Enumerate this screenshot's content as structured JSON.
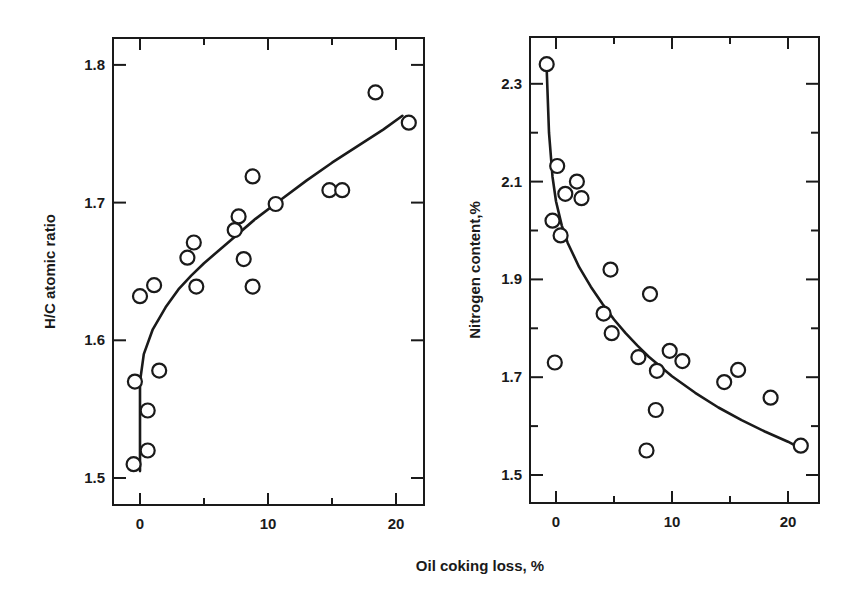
{
  "figure": {
    "xlabel": "Oil coking loss, %",
    "colors": {
      "ink": "#1a1a1a",
      "background": "#ffffff"
    }
  },
  "chart_data": [
    {
      "type": "scatter",
      "title": "",
      "xlabel": "Oil coking loss, %",
      "ylabel": "H/C atomic ratio",
      "xlim": [
        -2,
        22
      ],
      "ylim": [
        1.48,
        1.82
      ],
      "xticks": [
        0,
        10,
        20
      ],
      "xtick_labels": [
        "0",
        "10",
        "20"
      ],
      "xticks_minor": [
        5,
        15
      ],
      "yticks": [
        1.5,
        1.6,
        1.7,
        1.8
      ],
      "ytick_labels": [
        "1.5",
        "1.6",
        "1.7",
        "1.8"
      ],
      "grid": false,
      "legend": null,
      "series": [
        {
          "name": "measured",
          "marker": "open-circle",
          "points": [
            [
              0.0,
              1.632
            ],
            [
              1.1,
              1.64
            ],
            [
              -0.4,
              1.57
            ],
            [
              1.5,
              1.578
            ],
            [
              0.6,
              1.549
            ],
            [
              0.6,
              1.52
            ],
            [
              -0.5,
              1.51
            ],
            [
              3.7,
              1.66
            ],
            [
              4.2,
              1.671
            ],
            [
              4.4,
              1.639
            ],
            [
              7.4,
              1.68
            ],
            [
              7.7,
              1.69
            ],
            [
              8.1,
              1.659
            ],
            [
              8.8,
              1.719
            ],
            [
              8.8,
              1.639
            ],
            [
              10.6,
              1.699
            ],
            [
              14.8,
              1.709
            ],
            [
              15.8,
              1.709
            ],
            [
              18.4,
              1.78
            ],
            [
              21.0,
              1.758
            ]
          ]
        },
        {
          "name": "fit",
          "marker": "line",
          "points": [
            [
              0.0,
              1.505
            ],
            [
              0.0,
              1.57
            ],
            [
              0.3,
              1.59
            ],
            [
              1.0,
              1.608
            ],
            [
              2.0,
              1.624
            ],
            [
              3.0,
              1.637
            ],
            [
              4.0,
              1.647
            ],
            [
              5.0,
              1.656
            ],
            [
              7.0,
              1.672
            ],
            [
              9.0,
              1.688
            ],
            [
              11.0,
              1.702
            ],
            [
              13.0,
              1.716
            ],
            [
              15.0,
              1.729
            ],
            [
              17.0,
              1.741
            ],
            [
              19.0,
              1.753
            ],
            [
              20.5,
              1.763
            ]
          ]
        }
      ]
    },
    {
      "type": "scatter",
      "title": "",
      "xlabel": "Oil coking loss, %",
      "ylabel": "Nitrogen content,%",
      "xlim": [
        -2,
        23
      ],
      "ylim": [
        1.45,
        2.4
      ],
      "xticks": [
        0,
        10,
        20
      ],
      "xtick_labels": [
        "0",
        "10",
        "20"
      ],
      "xticks_minor": [
        5,
        15
      ],
      "yticks": [
        1.5,
        1.7,
        1.9,
        2.1,
        2.3
      ],
      "ytick_labels": [
        "1.5",
        "1.7",
        "1.9",
        "2.1",
        "2.3"
      ],
      "yticks_minor": [
        1.6,
        1.8,
        2.0,
        2.2
      ],
      "grid": false,
      "legend": null,
      "series": [
        {
          "name": "measured",
          "marker": "open-circle",
          "points": [
            [
              -0.8,
              2.34
            ],
            [
              0.1,
              2.132
            ],
            [
              0.8,
              2.075
            ],
            [
              1.8,
              2.1
            ],
            [
              2.2,
              2.066
            ],
            [
              -0.3,
              2.02
            ],
            [
              0.4,
              1.99
            ],
            [
              4.7,
              1.92
            ],
            [
              8.1,
              1.87
            ],
            [
              4.1,
              1.83
            ],
            [
              4.8,
              1.79
            ],
            [
              -0.1,
              1.73
            ],
            [
              7.1,
              1.741
            ],
            [
              9.8,
              1.754
            ],
            [
              10.9,
              1.733
            ],
            [
              8.7,
              1.713
            ],
            [
              8.6,
              1.633
            ],
            [
              7.8,
              1.55
            ],
            [
              14.5,
              1.69
            ],
            [
              15.7,
              1.715
            ],
            [
              18.5,
              1.658
            ],
            [
              21.1,
              1.56
            ]
          ]
        },
        {
          "name": "fit",
          "marker": "line",
          "points": [
            [
              -0.8,
              2.33
            ],
            [
              -0.6,
              2.2
            ],
            [
              -0.3,
              2.11
            ],
            [
              0.0,
              2.06
            ],
            [
              0.5,
              2.01
            ],
            [
              1.0,
              1.975
            ],
            [
              2.0,
              1.925
            ],
            [
              3.0,
              1.885
            ],
            [
              4.0,
              1.85
            ],
            [
              5.0,
              1.818
            ],
            [
              6.0,
              1.79
            ],
            [
              7.0,
              1.765
            ],
            [
              8.0,
              1.742
            ],
            [
              10.0,
              1.702
            ],
            [
              12.0,
              1.668
            ],
            [
              14.0,
              1.638
            ],
            [
              16.0,
              1.612
            ],
            [
              18.0,
              1.589
            ],
            [
              20.0,
              1.568
            ],
            [
              20.8,
              1.558
            ]
          ]
        }
      ]
    }
  ]
}
